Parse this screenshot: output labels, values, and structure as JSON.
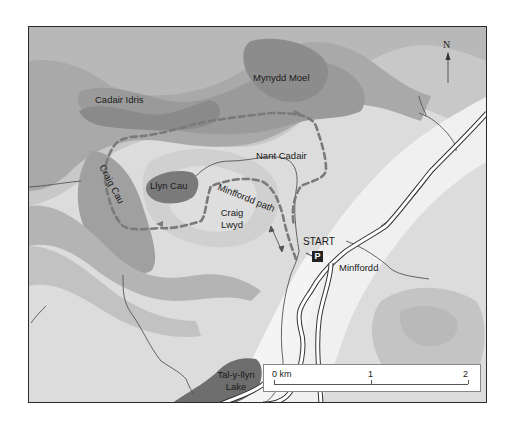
{
  "map": {
    "title": "Cadair Idris — Minffordd path walking route",
    "colors": {
      "frame": "#2a2a2a",
      "route": "#7a7a7a",
      "stream": "#555555",
      "road_casing": "#333333",
      "road_fill": "#ffffff",
      "lake": "#6e6e6e",
      "parking_bg": "#222222"
    },
    "labels": {
      "mynydd_moel": "Mynydd Moel",
      "cadair_idris": "Cadair Idris",
      "nant_cadair": "Nant Cadair",
      "llyn_cau": "Llyn Cau",
      "craig_cau": "Craig Cau",
      "minffordd_path": "Minffordd path",
      "craig_lwyd_line1": "Craig",
      "craig_lwyd_line2": "Lwyd",
      "start": "START",
      "minffordd": "Minffordd",
      "lake_line1": "Tal-y-llyn",
      "lake_line2": "Lake"
    },
    "north_arrow": {
      "label": "N",
      "icon": "north-arrow-icon"
    },
    "parking": {
      "label": "P",
      "icon": "parking-icon"
    },
    "scale_bar": {
      "unit_label": "0 km",
      "mid_label": "1",
      "end_label": "2"
    }
  }
}
